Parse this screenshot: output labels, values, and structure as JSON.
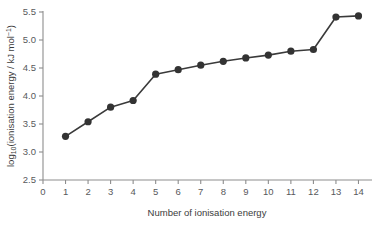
{
  "chart_data": {
    "type": "line",
    "title": "",
    "subtitle": "",
    "xlabel": "Number of ionisation energy",
    "ylabel": "log10(ionisation energy / kJ mol-1)",
    "ylabel_parts": {
      "prefix": "log",
      "subscript": "10",
      "middle": "(ionisation energy / kJ mol",
      "superscript": "−1",
      "suffix": ")"
    },
    "x": [
      1,
      2,
      3,
      4,
      5,
      6,
      7,
      8,
      9,
      10,
      11,
      12,
      13,
      14
    ],
    "values": [
      3.28,
      3.54,
      3.8,
      3.92,
      4.39,
      4.47,
      4.55,
      4.62,
      4.68,
      4.73,
      4.8,
      4.83,
      5.41,
      5.43
    ],
    "series": [
      {
        "name": "ionisation energies",
        "values": [
          3.28,
          3.54,
          3.8,
          3.92,
          4.39,
          4.47,
          4.55,
          4.62,
          4.68,
          4.73,
          4.8,
          4.83,
          5.41,
          5.43
        ]
      }
    ],
    "xlim": [
      0,
      14.6
    ],
    "ylim": [
      2.5,
      5.5
    ],
    "xticks": [
      0,
      1,
      2,
      3,
      4,
      5,
      6,
      7,
      8,
      9,
      10,
      11,
      12,
      13,
      14
    ],
    "xtick_labels": [
      "0",
      "1",
      "2",
      "3",
      "4",
      "5",
      "6",
      "7",
      "8",
      "9",
      "10",
      "11",
      "12",
      "13",
      "14"
    ],
    "yticks": [
      2.5,
      3.0,
      3.5,
      4.0,
      4.5,
      5.0,
      5.5
    ],
    "ytick_labels": [
      "2.5",
      "3.0",
      "3.5",
      "4.0",
      "4.5",
      "5.0",
      "5.5"
    ],
    "grid": false,
    "legend": false,
    "legend_position": "none",
    "marker": "circle",
    "colors": {
      "line": "#3a3a3a",
      "marker": "#333333",
      "axis": "#8d8d8d",
      "tick_label": "#58595b",
      "axis_title": "#3b3b3b",
      "background": "#ffffff"
    }
  }
}
